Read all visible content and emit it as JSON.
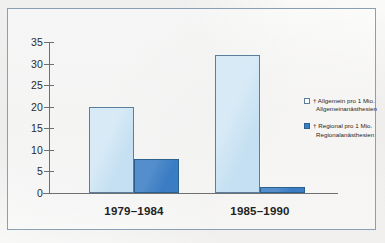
{
  "chart_data": {
    "type": "bar",
    "title": "",
    "xlabel": "",
    "ylabel": "",
    "categories": [
      "1979–1984",
      "1985–1990"
    ],
    "ylim": [
      0,
      35
    ],
    "yticks": [
      0,
      5,
      10,
      15,
      20,
      25,
      30,
      35
    ],
    "ytick_labels": [
      "0",
      "5",
      "10",
      "15",
      "20",
      "25",
      "30",
      "35"
    ],
    "grid": false,
    "legend_position": "right",
    "series": [
      {
        "name": "† Allgemein pro 1 Mio. Allgemeinanästhesien",
        "legend_line1": "† Allgemein pro 1 Mio.",
        "legend_line2": "Allgemeinanästhesien",
        "color": "#c5e0f2",
        "border_color": "#5b7e9e",
        "values": [
          20,
          32
        ]
      },
      {
        "name": "† Regional pro 1 Mio. Regionalanästhesien",
        "legend_line1": "† Regional pro 1 Mio.",
        "legend_line2": "Regionalanästhesien",
        "color": "#3b7dc4",
        "border_color": "#2c608f",
        "values": [
          8,
          1.5
        ]
      }
    ]
  },
  "frame": {
    "border_color": "#8a9fb4"
  },
  "axis": {
    "color": "#6f6f6f"
  }
}
